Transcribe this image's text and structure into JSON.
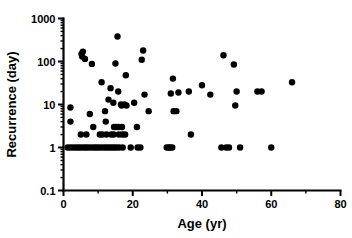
{
  "chart_data": {
    "type": "scatter",
    "title": "",
    "xlabel": "Age (yr)",
    "ylabel": "Recurrence (day)",
    "xlim": [
      0,
      80
    ],
    "ylim": [
      0.1,
      1000
    ],
    "yscale": "log",
    "xscale": "linear",
    "grid": false,
    "legend": null,
    "xticks": [
      0,
      20,
      40,
      60,
      80
    ],
    "xticklabels": [
      "0",
      "20",
      "40",
      "60",
      "80"
    ],
    "xminorticks": [
      10,
      30,
      50,
      70
    ],
    "yticks": [
      0.1,
      1,
      10,
      100,
      1000
    ],
    "yticklabels": [
      "0.1",
      "1",
      "10",
      "100",
      "1000"
    ],
    "marker": "circle",
    "marker_color": "#000000",
    "marker_size": 3.2,
    "points": [
      [
        2.0,
        8.5
      ],
      [
        2.0,
        4.0
      ],
      [
        1.2,
        1.0
      ],
      [
        2.0,
        1.0
      ],
      [
        2.8,
        1.0
      ],
      [
        3.6,
        1.0
      ],
      [
        4.3,
        1.0
      ],
      [
        5.0,
        1.0
      ],
      [
        5.2,
        150.0
      ],
      [
        5.6,
        170.0
      ],
      [
        5.4,
        130.0
      ],
      [
        6.2,
        115.0
      ],
      [
        5.0,
        2.0
      ],
      [
        5.8,
        1.0
      ],
      [
        6.5,
        1.0
      ],
      [
        6.6,
        2.0
      ],
      [
        7.2,
        1.0
      ],
      [
        7.6,
        6.0
      ],
      [
        8.0,
        1.0
      ],
      [
        8.2,
        88.0
      ],
      [
        8.6,
        3.0
      ],
      [
        8.8,
        1.0
      ],
      [
        9.5,
        1.0
      ],
      [
        10.2,
        1.0
      ],
      [
        10.5,
        2.0
      ],
      [
        11.0,
        33.0
      ],
      [
        11.2,
        2.0
      ],
      [
        11.0,
        1.0
      ],
      [
        11.8,
        1.0
      ],
      [
        12.0,
        7.0
      ],
      [
        12.2,
        4.0
      ],
      [
        12.4,
        2.0
      ],
      [
        12.5,
        1.0
      ],
      [
        13.0,
        13.0
      ],
      [
        13.2,
        1.0
      ],
      [
        13.6,
        24.0
      ],
      [
        13.8,
        2.0
      ],
      [
        13.9,
        1.0
      ],
      [
        14.4,
        11.0
      ],
      [
        14.6,
        3.0
      ],
      [
        14.5,
        2.0
      ],
      [
        14.6,
        1.0
      ],
      [
        15.0,
        90.0
      ],
      [
        15.2,
        3.0
      ],
      [
        15.3,
        1.0
      ],
      [
        15.6,
        380.0
      ],
      [
        15.8,
        20.0
      ],
      [
        15.9,
        3.0
      ],
      [
        16.0,
        2.0
      ],
      [
        16.1,
        1.0
      ],
      [
        16.6,
        10.0
      ],
      [
        16.8,
        9.5
      ],
      [
        16.9,
        3.0
      ],
      [
        17.0,
        2.0
      ],
      [
        17.1,
        1.0
      ],
      [
        17.6,
        10.0
      ],
      [
        17.8,
        2.0
      ],
      [
        18.0,
        48.0
      ],
      [
        18.2,
        9.5
      ],
      [
        19.4,
        1.0
      ],
      [
        20.4,
        11.0
      ],
      [
        21.2,
        3.0
      ],
      [
        21.4,
        1.0
      ],
      [
        22.2,
        1.0
      ],
      [
        22.6,
        110.0
      ],
      [
        23.0,
        180.0
      ],
      [
        23.4,
        17.0
      ],
      [
        24.6,
        7.0
      ],
      [
        29.8,
        1.0
      ],
      [
        30.4,
        1.0
      ],
      [
        30.8,
        1.0
      ],
      [
        31.0,
        18.0
      ],
      [
        31.4,
        1.0
      ],
      [
        31.6,
        40.0
      ],
      [
        31.8,
        7.0
      ],
      [
        32.6,
        7.0
      ],
      [
        33.2,
        19.0
      ],
      [
        36.8,
        2.0
      ],
      [
        36.2,
        20.0
      ],
      [
        40.0,
        28.0
      ],
      [
        42.4,
        17.0
      ],
      [
        45.6,
        1.0
      ],
      [
        46.2,
        140.0
      ],
      [
        47.0,
        1.0
      ],
      [
        47.8,
        1.0
      ],
      [
        49.2,
        85.0
      ],
      [
        49.6,
        9.5
      ],
      [
        50.0,
        20.0
      ],
      [
        51.0,
        1.0
      ],
      [
        56.0,
        20.0
      ],
      [
        57.2,
        20.0
      ],
      [
        60.0,
        1.0
      ],
      [
        66.0,
        33.0
      ]
    ]
  },
  "axes": {
    "y_title": "Recurrence (day)",
    "x_title": "Age (yr)"
  }
}
